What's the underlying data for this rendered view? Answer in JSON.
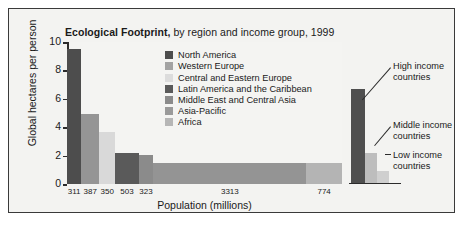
{
  "chart_data": {
    "type": "bar",
    "title_bold": "Ecological Footprint,",
    "title_rest": " by region and income group, 1999",
    "xlabel": "Population (millions)",
    "ylabel": "Global hectares per person",
    "ylim": [
      0,
      10
    ],
    "yticks": [
      0,
      2,
      4,
      6,
      8,
      10
    ],
    "ytick_labels": [
      "0",
      "2",
      "4",
      "6",
      "8",
      "10"
    ],
    "grid": false,
    "legend_position": "inside-top-center",
    "x_is_population_width": true,
    "categories": [
      "North America",
      "Western Europe",
      "Central and Eastern Europe",
      "Latin America and the Caribbean",
      "Middle East and Central Asia",
      "Asia-Pacific",
      "Africa"
    ],
    "values": [
      9.5,
      4.9,
      3.65,
      2.18,
      2.05,
      1.5,
      1.48
    ],
    "populations": [
      311,
      387,
      350,
      503,
      323,
      3313,
      774
    ],
    "population_labels": [
      "311",
      "387",
      "350",
      "503",
      "323",
      "3313",
      "774"
    ],
    "colors": [
      "#4d4d4d",
      "#959595",
      "#d9d9d9",
      "#5a5a5a",
      "#8b8b8b",
      "#949494",
      "#b4b4b4"
    ],
    "income_panel": {
      "series": [
        {
          "name": "High income countries",
          "value": 6.6,
          "color": "#4f4f4f"
        },
        {
          "name": "Middle income countries",
          "value": 2.1,
          "color": "#bdbdbd"
        },
        {
          "name": "Low income countries",
          "value": 0.8,
          "color": "#cfcfcf"
        }
      ],
      "annotations": [
        {
          "line1": "High income",
          "line2": "countries"
        },
        {
          "line1": "Middle income",
          "line2": "countries"
        },
        {
          "line1": "Low income",
          "line2": "countries"
        }
      ]
    }
  },
  "legend": {
    "items": [
      {
        "label": "North America",
        "color": "#4d4d4d"
      },
      {
        "label": "Western Europe",
        "color": "#a3a3a3"
      },
      {
        "label": "Central and Eastern Europe",
        "color": "#dcdcdc"
      },
      {
        "label": "Latin America and the Caribbean",
        "color": "#5a5a5a"
      },
      {
        "label": "Middle East and Central Asia",
        "color": "#8b8b8b"
      },
      {
        "label": "Asia-Pacific",
        "color": "#9a9a9a"
      },
      {
        "label": "Africa",
        "color": "#b6b6b6"
      }
    ]
  }
}
